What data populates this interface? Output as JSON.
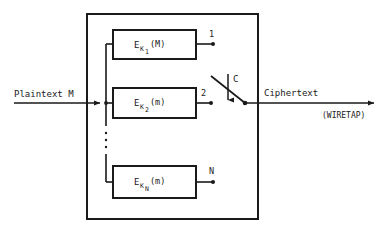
{
  "figure": {
    "input": {
      "label": "Plaintext M"
    },
    "output": {
      "label": "Ciphertext",
      "annotation": "(WIRETAP)"
    },
    "switch": {
      "control_label": "C",
      "icon": "switch-arm-icon",
      "control_icon": "down-arrow-icon"
    },
    "encryptors": [
      {
        "symbol": "E",
        "subscript": "K",
        "index": "1",
        "argument": "(M)",
        "output_label": "1"
      },
      {
        "symbol": "E",
        "subscript": "K",
        "index": "2",
        "argument": "(m)",
        "output_label": "2"
      },
      {
        "symbol": "E",
        "subscript": "K",
        "index": "N",
        "argument": "(m)",
        "output_label": "N"
      }
    ],
    "ellipsis": "vertical-ellipsis",
    "colors": {
      "stroke": "#1a1a1a",
      "background": "#ffffff"
    }
  }
}
